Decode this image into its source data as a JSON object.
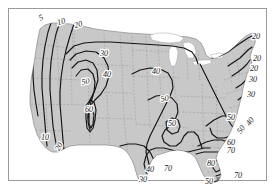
{
  "figure": {
    "type": "contour-map",
    "region": "Contiguous United States",
    "frame_visible": true,
    "background_color": "#ffffff",
    "frame_color": "#9a9a9a",
    "land_fill_color": "#c8c8c8",
    "land_outline_color": "#8a8a8a",
    "state_border_color": "#9b9b9b",
    "state_border_style": "dashed",
    "contour_color": "#141414",
    "lake_fill_color": "#ffffff"
  },
  "chart_data": {
    "type": "contour",
    "title": "",
    "xlabel": "",
    "ylabel": "",
    "legend": [],
    "grid": false,
    "contour_levels": [
      5,
      10,
      20,
      30,
      40,
      50,
      60,
      70,
      80
    ],
    "value_range": [
      5,
      80
    ],
    "contour_interval": 10,
    "labels": [
      {
        "text": "5",
        "x": 42,
        "y": 20,
        "rot": -22,
        "region": "pacific-northwest"
      },
      {
        "text": "10",
        "x": 62,
        "y": 24,
        "rot": -18,
        "region": "pacific-northwest"
      },
      {
        "text": "20",
        "x": 79,
        "y": 27,
        "rot": -16,
        "region": "pacific-northwest"
      },
      {
        "text": "30",
        "x": 104,
        "y": 56,
        "rot": 0,
        "region": "northern-plains"
      },
      {
        "text": "40",
        "x": 107,
        "y": 77,
        "rot": 0,
        "region": "northern-rockies"
      },
      {
        "text": "50",
        "x": 86,
        "y": 84,
        "rot": -10,
        "region": "great-basin"
      },
      {
        "text": "60",
        "x": 89,
        "y": 112,
        "rot": 0,
        "region": "desert-southwest"
      },
      {
        "text": "40",
        "x": 156,
        "y": 74,
        "rot": 0,
        "region": "midwest"
      },
      {
        "text": "50",
        "x": 165,
        "y": 101,
        "rot": -8,
        "region": "central-plains"
      },
      {
        "text": "50",
        "x": 172,
        "y": 126,
        "rot": 0,
        "region": "south-central"
      },
      {
        "text": "10",
        "x": 45,
        "y": 140,
        "rot": 0,
        "region": "california-coast"
      },
      {
        "text": "20",
        "x": 61,
        "y": 148,
        "rot": -60,
        "region": "california-coast"
      },
      {
        "text": "40",
        "x": 150,
        "y": 172,
        "rot": 0,
        "region": "texas"
      },
      {
        "text": "30",
        "x": 143,
        "y": 182,
        "rot": 0,
        "region": "texas"
      },
      {
        "text": "70",
        "x": 168,
        "y": 171,
        "rot": 0,
        "region": "gulf-coast"
      },
      {
        "text": "20",
        "x": 256,
        "y": 39,
        "rot": 0,
        "region": "northeast"
      },
      {
        "text": "20",
        "x": 257,
        "y": 61,
        "rot": 0,
        "region": "northeast"
      },
      {
        "text": "20",
        "x": 254,
        "y": 71,
        "rot": 0,
        "region": "northeast"
      },
      {
        "text": "30",
        "x": 253,
        "y": 82,
        "rot": 0,
        "region": "mid-atlantic"
      },
      {
        "text": "30",
        "x": 251,
        "y": 97,
        "rot": 0,
        "region": "mid-atlantic"
      },
      {
        "text": "50",
        "x": 231,
        "y": 120,
        "rot": 0,
        "region": "southeast"
      },
      {
        "text": "40",
        "x": 252,
        "y": 123,
        "rot": -55,
        "region": "atlantic-coast"
      },
      {
        "text": "50",
        "x": 243,
        "y": 131,
        "rot": -55,
        "region": "atlantic-coast"
      },
      {
        "text": "60",
        "x": 231,
        "y": 145,
        "rot": 0,
        "region": "southeast"
      },
      {
        "text": "70",
        "x": 231,
        "y": 153,
        "rot": 0,
        "region": "southeast"
      },
      {
        "text": "80",
        "x": 211,
        "y": 166,
        "rot": 0,
        "region": "florida"
      },
      {
        "text": "70",
        "x": 238,
        "y": 178,
        "rot": 0,
        "region": "florida"
      },
      {
        "text": "50",
        "x": 209,
        "y": 184,
        "rot": 0,
        "region": "florida"
      }
    ]
  }
}
